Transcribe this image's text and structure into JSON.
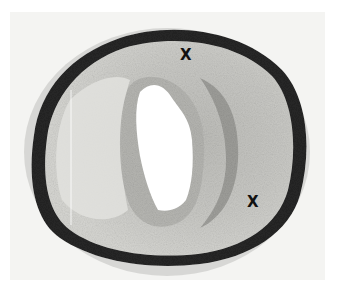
{
  "image": {
    "subject": "Cross-section of artery (photomicrograph)",
    "style": "grayscale",
    "background_color": "#f4f4f2"
  },
  "markers": [
    {
      "label": "X",
      "x": 180,
      "y": 48
    },
    {
      "label": "X",
      "x": 247,
      "y": 195
    }
  ],
  "colors": {
    "outer_wall": "#2a2a2a",
    "adventitia": "#9a9a98",
    "intima_light": "#dcdcd8",
    "intima_dark": "#a8a8a4",
    "lumen": "#ffffff"
  }
}
